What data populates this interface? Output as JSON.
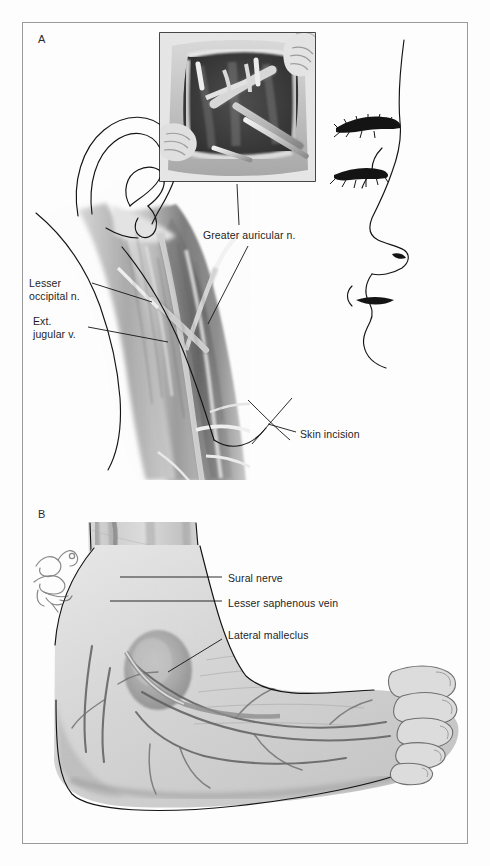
{
  "figure": {
    "type": "medical-anatomical-illustration",
    "background_color": "#fdfdfd",
    "frame_color": "#9a9a9a",
    "ink_color": "#141414",
    "width": 490,
    "height": 866
  },
  "panels": [
    {
      "id": "A",
      "letter": "A",
      "subject": "Lateral head and neck — greater auricular nerve harvest",
      "has_inset_photo": true,
      "inset_caption": "surgical-field-inset",
      "labels": [
        {
          "id": "greater-auricular-n",
          "text": "Greater auricular n."
        },
        {
          "id": "lesser-occipital-n",
          "text": "Lesser\noccipital n."
        },
        {
          "id": "ext-jugular-v",
          "text": "Ext.\njugular v."
        },
        {
          "id": "skin-incision",
          "text": "Skin incision"
        }
      ]
    },
    {
      "id": "B",
      "letter": "B",
      "subject": "Lateral ankle and foot — sural nerve harvest",
      "has_inset_photo": false,
      "labels": [
        {
          "id": "sural-nerve",
          "text": "Sural nerve"
        },
        {
          "id": "lesser-saphenous-vein",
          "text": "Lesser saphenous vein"
        },
        {
          "id": "lateral-malleclus",
          "text": "Lateral malleclus"
        }
      ],
      "artist_signature": {
        "present": true,
        "year_mark": "'02"
      }
    }
  ]
}
